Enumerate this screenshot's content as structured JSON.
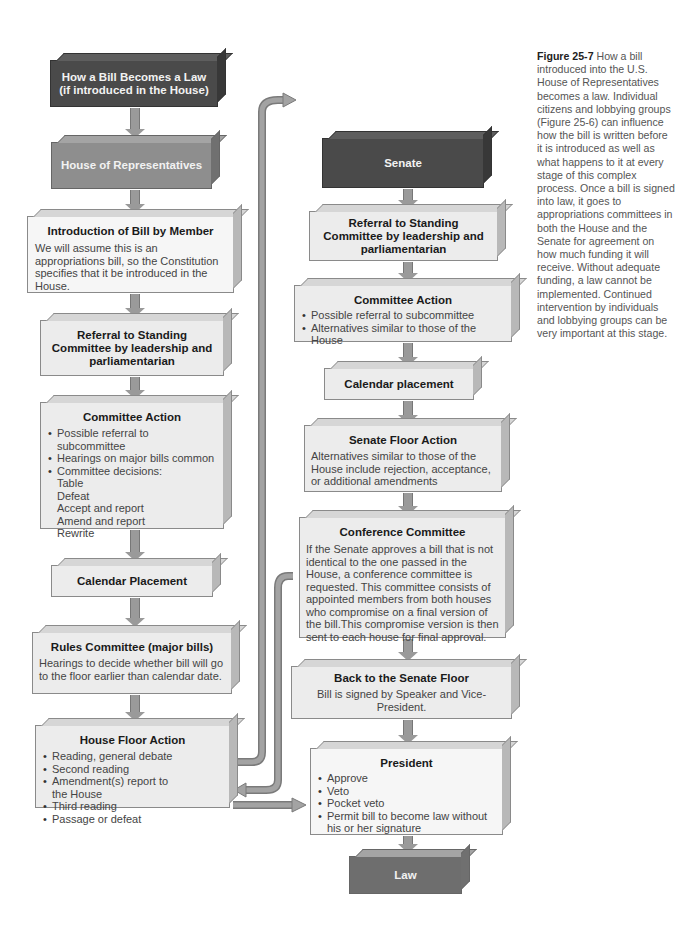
{
  "diagram": {
    "house": {
      "header": {
        "title": "How a Bill Becomes a Law (if introduced in the House)"
      },
      "chamber": {
        "title": "House of Representatives"
      },
      "introduction": {
        "title": "Introduction of Bill by Member",
        "text": "We will assume this is an appropriations bill, so the Constitution specifies that it be introduced in the House."
      },
      "referral": {
        "title": "Referral to Standing Committee by leadership and parliamentarian"
      },
      "committee_action": {
        "title": "Committee Action",
        "items": [
          "Possible referral to subcommittee",
          "Hearings on major bills common",
          "Committee decisions:"
        ],
        "sub_items": [
          "Table",
          "Defeat",
          "Accept and report",
          "Amend and report",
          "Rewrite"
        ]
      },
      "calendar": {
        "title": "Calendar Placement"
      },
      "rules": {
        "title": "Rules Committee (major bills)",
        "text": "Hearings to decide whether bill will go to the floor earlier than calendar date."
      },
      "floor": {
        "title": "House Floor Action",
        "items": [
          "Reading, general debate",
          "Second reading",
          "Amendment(s) report to the House",
          "Third reading",
          "Passage or defeat"
        ]
      }
    },
    "senate": {
      "chamber": {
        "title": "Senate"
      },
      "referral": {
        "title": "Referral to Standing Committee by leadership and parliamentarian"
      },
      "committee_action": {
        "title": "Committee Action",
        "items": [
          "Possible referral to subcommittee",
          "Alternatives similar to those of the House"
        ]
      },
      "calendar": {
        "title": "Calendar placement"
      },
      "floor": {
        "title": "Senate Floor Action",
        "text": "Alternatives similar to those of the House include rejection, acceptance, or additional amendments"
      },
      "conference": {
        "title": "Conference Committee",
        "text": "If the Senate approves a bill that is not identical to the one passed in the House, a conference committee is requested. This committee consists of appointed members from both houses who compromise on a final version of the bill.This compromise version is then sent to each house for final approval."
      },
      "back_to_floor": {
        "title": "Back to the Senate Floor",
        "text": "Bill is signed by Speaker and Vice-President."
      },
      "president": {
        "title": "President",
        "items": [
          "Approve",
          "Veto",
          "Pocket veto",
          "Permit bill to become law without his or her signature"
        ]
      },
      "law": {
        "title": "Law"
      }
    }
  },
  "caption": {
    "label": "Figure 25-7",
    "text": "How a bill introduced into the U.S. House of Representatives becomes a law. Individual citizens and lobbying groups (Figure 25-6) can influence how the bill is written before it is introduced as well as what happens to it at every stage of this complex process. Once a bill is signed into law, it goes to appropriations committees in both the House and the Senate for agreement on how much funding it will receive. Without adequate funding, a law cannot be implemented. Continued intervention by individuals and lobbying groups can be very important at this stage."
  },
  "colors": {
    "dark_box": "#4a4a4a",
    "mid_box": "#8e8e8e",
    "light_box": "#ececec",
    "arrow": "#9a9a9a"
  }
}
